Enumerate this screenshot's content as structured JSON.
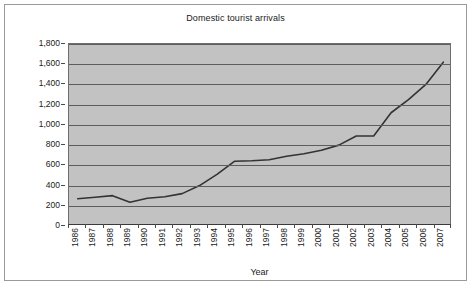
{
  "chart_data": {
    "type": "line",
    "title": "Domestic tourist arrivals",
    "xlabel": "Year",
    "ylabel": "Millions",
    "grid": true,
    "legend": false,
    "ylim": [
      0,
      1800
    ],
    "ytick_step": 200,
    "yticks": [
      "0",
      "200",
      "400",
      "600",
      "800",
      "1,000",
      "1,200",
      "1,400",
      "1,600",
      "1,800"
    ],
    "ytick_values": [
      0,
      200,
      400,
      600,
      800,
      1000,
      1200,
      1400,
      1600,
      1800
    ],
    "categories": [
      "1986",
      "1987",
      "1988",
      "1989",
      "1990",
      "1991",
      "1992",
      "1993",
      "1994",
      "1995",
      "1996",
      "1997",
      "1998",
      "1999",
      "2000",
      "2001",
      "2002",
      "2003",
      "2004",
      "2005",
      "2006",
      "2007"
    ],
    "series": [
      {
        "name": "Domestic tourist arrivals",
        "values": [
          270,
          285,
          300,
          235,
          275,
          290,
          320,
          400,
          510,
          640,
          645,
          655,
          690,
          715,
          750,
          800,
          890,
          890,
          1120,
          1250,
          1400,
          1620
        ]
      }
    ],
    "colors": {
      "plot_background": "#c2c2c2",
      "gridline": "#5d5d5d",
      "line": "#333333",
      "axis": "#3a3a3a",
      "text": "#1a1a1a",
      "frame_border": "#9a9a9a",
      "page_background": "#ffffff"
    }
  }
}
